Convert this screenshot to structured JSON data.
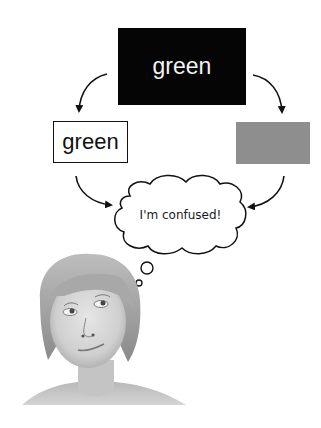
{
  "diagram": {
    "top_box": {
      "label": "green",
      "fill": "#050505",
      "text_color": "#f2f2f2"
    },
    "left_box": {
      "label": "green",
      "fill": "#ffffff",
      "text_color": "#111111"
    },
    "right_box": {
      "label": "",
      "fill": "#8e8e8e"
    },
    "thought_bubble": {
      "text": "I'm confused!"
    },
    "arrows": [
      {
        "from": "top_box",
        "to": "left_box"
      },
      {
        "from": "top_box",
        "to": "right_box"
      },
      {
        "from": "left_box",
        "to": "thought_bubble"
      },
      {
        "from": "right_box",
        "to": "thought_bubble"
      }
    ],
    "photo": {
      "subject": "person looking up, puzzled (grayscale)"
    }
  }
}
